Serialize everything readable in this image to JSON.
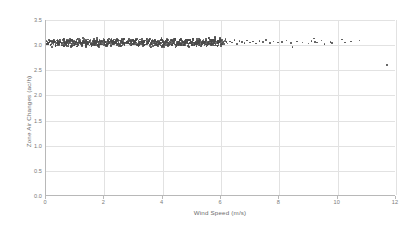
{
  "chart_data": {
    "type": "scatter",
    "title": "",
    "xlabel": "Wind Speed (m/s)",
    "ylabel": "Zone Air Changes (ac/h)",
    "xlim": [
      0,
      12
    ],
    "ylim": [
      0,
      3.5
    ],
    "xticks": [
      "0",
      "2",
      "4",
      "6",
      "8",
      "10",
      "12"
    ],
    "yticks": [
      "0.0",
      "0.5",
      "1.0",
      "1.5",
      "2.0",
      "2.5",
      "3.0",
      "3.5"
    ],
    "xtick_values": [
      0,
      2,
      4,
      6,
      8,
      10,
      12
    ],
    "ytick_values": [
      0.0,
      0.5,
      1.0,
      1.5,
      2.0,
      2.5,
      3.0,
      3.5
    ],
    "grid": "both",
    "legend": "none",
    "series": [
      {
        "name": "Zone air changes vs wind speed",
        "marker": "dot",
        "color": "#4a4a4a",
        "description": "Dense horizontal band of points clustered near 3.05 ac/h across 0-6 m/s, thinning to sparse isolated points from 6-11 m/s, with a single low outlier near 2.6 ac/h at 11.7 m/s",
        "points": [
          [
            0.05,
            3.06
          ],
          [
            0.09,
            3.02
          ],
          [
            0.13,
            3.09
          ],
          [
            0.17,
            3.01
          ],
          [
            0.21,
            3.07
          ],
          [
            0.25,
            3.04
          ],
          [
            0.29,
            3.1
          ],
          [
            0.33,
            3.0
          ],
          [
            0.37,
            3.05
          ],
          [
            0.41,
            3.08
          ],
          [
            0.45,
            3.02
          ],
          [
            0.49,
            3.07
          ],
          [
            0.53,
            3.03
          ],
          [
            0.57,
            3.09
          ],
          [
            0.61,
            3.01
          ],
          [
            0.65,
            3.06
          ],
          [
            0.69,
            3.04
          ],
          [
            0.73,
            3.08
          ],
          [
            0.77,
            3.02
          ],
          [
            0.81,
            3.05
          ],
          [
            0.85,
            3.1
          ],
          [
            0.89,
            3.0
          ],
          [
            0.93,
            3.07
          ],
          [
            0.97,
            3.03
          ],
          [
            1.01,
            3.06
          ],
          [
            1.05,
            3.09
          ],
          [
            1.09,
            3.01
          ],
          [
            1.13,
            3.05
          ],
          [
            1.17,
            3.08
          ],
          [
            1.21,
            3.02
          ],
          [
            1.25,
            3.04
          ],
          [
            1.29,
            3.1
          ],
          [
            1.33,
            3.06
          ],
          [
            1.37,
            3.0
          ],
          [
            1.41,
            3.07
          ],
          [
            1.45,
            3.03
          ],
          [
            1.49,
            3.09
          ],
          [
            1.53,
            3.05
          ],
          [
            1.57,
            3.01
          ],
          [
            1.61,
            3.08
          ],
          [
            1.65,
            3.02
          ],
          [
            1.69,
            3.06
          ],
          [
            1.73,
            3.04
          ],
          [
            1.77,
            3.1
          ],
          [
            1.81,
            3.0
          ],
          [
            1.85,
            3.07
          ],
          [
            1.89,
            3.03
          ],
          [
            1.93,
            3.05
          ],
          [
            1.97,
            3.09
          ],
          [
            2.01,
            3.02
          ],
          [
            2.05,
            3.06
          ],
          [
            2.09,
            3.01
          ],
          [
            2.13,
            3.08
          ],
          [
            2.17,
            3.04
          ],
          [
            2.21,
            3.1
          ],
          [
            2.25,
            3.0
          ],
          [
            2.29,
            3.05
          ],
          [
            2.33,
            3.07
          ],
          [
            2.37,
            3.03
          ],
          [
            2.41,
            3.09
          ],
          [
            2.45,
            3.02
          ],
          [
            2.49,
            3.06
          ],
          [
            2.53,
            3.01
          ],
          [
            2.57,
            3.08
          ],
          [
            2.61,
            3.04
          ],
          [
            2.65,
            3.1
          ],
          [
            2.69,
            3.0
          ],
          [
            2.73,
            3.05
          ],
          [
            2.77,
            3.07
          ],
          [
            2.81,
            3.03
          ],
          [
            2.85,
            3.09
          ],
          [
            2.89,
            3.02
          ],
          [
            2.93,
            3.06
          ],
          [
            2.97,
            3.01
          ],
          [
            3.01,
            3.08
          ],
          [
            3.05,
            3.04
          ],
          [
            3.09,
            3.1
          ],
          [
            3.13,
            3.0
          ],
          [
            3.17,
            3.05
          ],
          [
            3.21,
            3.07
          ],
          [
            3.25,
            3.03
          ],
          [
            3.29,
            3.09
          ],
          [
            3.33,
            3.02
          ],
          [
            3.37,
            3.06
          ],
          [
            3.41,
            3.01
          ],
          [
            3.45,
            3.08
          ],
          [
            3.49,
            3.04
          ],
          [
            3.53,
            3.1
          ],
          [
            3.57,
            3.0
          ],
          [
            3.61,
            3.05
          ],
          [
            3.65,
            3.07
          ],
          [
            3.69,
            3.03
          ],
          [
            3.73,
            3.09
          ],
          [
            3.77,
            3.02
          ],
          [
            3.81,
            3.06
          ],
          [
            3.85,
            3.01
          ],
          [
            3.89,
            3.08
          ],
          [
            3.93,
            3.04
          ],
          [
            3.97,
            3.1
          ],
          [
            4.01,
            3.0
          ],
          [
            4.05,
            3.05
          ],
          [
            4.09,
            3.07
          ],
          [
            4.13,
            3.03
          ],
          [
            4.17,
            3.09
          ],
          [
            4.21,
            3.02
          ],
          [
            4.25,
            3.06
          ],
          [
            4.29,
            3.01
          ],
          [
            4.33,
            3.08
          ],
          [
            4.37,
            3.04
          ],
          [
            4.41,
            3.1
          ],
          [
            4.45,
            3.0
          ],
          [
            4.49,
            3.05
          ],
          [
            4.53,
            3.07
          ],
          [
            4.57,
            3.03
          ],
          [
            4.61,
            3.09
          ],
          [
            4.65,
            3.02
          ],
          [
            4.69,
            3.06
          ],
          [
            4.73,
            3.01
          ],
          [
            4.77,
            3.08
          ],
          [
            4.81,
            3.04
          ],
          [
            4.85,
            3.1
          ],
          [
            4.89,
            3.0
          ],
          [
            4.93,
            3.05
          ],
          [
            4.97,
            3.07
          ],
          [
            5.01,
            3.03
          ],
          [
            5.05,
            3.09
          ],
          [
            5.09,
            3.02
          ],
          [
            5.13,
            3.06
          ],
          [
            5.17,
            3.01
          ],
          [
            5.21,
            3.08
          ],
          [
            5.25,
            3.04
          ],
          [
            5.29,
            3.1
          ],
          [
            5.33,
            3.0
          ],
          [
            5.37,
            3.05
          ],
          [
            5.41,
            3.07
          ],
          [
            5.45,
            3.03
          ],
          [
            5.49,
            3.09
          ],
          [
            5.53,
            3.02
          ],
          [
            5.57,
            3.06
          ],
          [
            5.61,
            3.11
          ],
          [
            5.65,
            3.04
          ],
          [
            5.69,
            3.08
          ],
          [
            5.73,
            3.01
          ],
          [
            5.77,
            3.06
          ],
          [
            5.81,
            3.12
          ],
          [
            5.85,
            3.03
          ],
          [
            5.89,
            3.07
          ],
          [
            5.93,
            3.05
          ],
          [
            5.97,
            3.1
          ],
          [
            6.01,
            3.02
          ],
          [
            6.08,
            3.06
          ],
          [
            6.15,
            3.09
          ],
          [
            6.22,
            3.03
          ],
          [
            6.3,
            3.07
          ],
          [
            6.38,
            3.05
          ],
          [
            6.46,
            3.1
          ],
          [
            6.55,
            3.02
          ],
          [
            6.63,
            3.08
          ],
          [
            6.72,
            3.06
          ],
          [
            6.8,
            3.04
          ],
          [
            6.9,
            3.09
          ],
          [
            7.0,
            3.05
          ],
          [
            7.1,
            3.07
          ],
          [
            7.2,
            3.03
          ],
          [
            7.32,
            3.08
          ],
          [
            7.44,
            3.06
          ],
          [
            7.55,
            3.1
          ],
          [
            7.68,
            3.04
          ],
          [
            7.8,
            3.07
          ],
          [
            7.95,
            3.05
          ],
          [
            8.1,
            3.06
          ],
          [
            8.25,
            3.09
          ],
          [
            8.4,
            3.04
          ],
          [
            8.45,
            2.96
          ],
          [
            8.6,
            3.07
          ],
          [
            8.8,
            3.05
          ],
          [
            9.0,
            3.03
          ],
          [
            9.1,
            3.08
          ],
          [
            9.18,
            3.13
          ],
          [
            9.22,
            3.06
          ],
          [
            9.3,
            3.05
          ],
          [
            9.45,
            3.09
          ],
          [
            9.55,
            3.02
          ],
          [
            9.75,
            3.06
          ],
          [
            9.8,
            3.04
          ],
          [
            10.15,
            3.11
          ],
          [
            10.25,
            3.05
          ],
          [
            10.45,
            3.07
          ],
          [
            10.75,
            3.09
          ],
          [
            11.7,
            2.6
          ]
        ]
      }
    ]
  }
}
